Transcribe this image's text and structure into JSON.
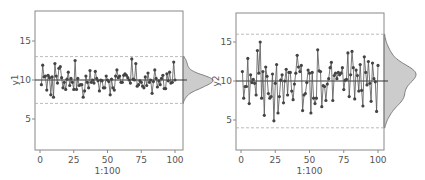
{
  "chart_data": [
    {
      "type": "line",
      "title": "",
      "xlabel": "1:100",
      "ylabel": "y1",
      "xlim": [
        -3,
        105
      ],
      "ylim": [
        1,
        18.7
      ],
      "xticks": [
        0,
        25,
        50,
        75,
        100
      ],
      "yticks": [
        5,
        10,
        15
      ],
      "grid": false,
      "center_line": 10,
      "control_limits": [
        7,
        13
      ],
      "marginal_density": true,
      "x": [
        1,
        2,
        3,
        4,
        5,
        6,
        7,
        8,
        9,
        10,
        11,
        12,
        13,
        14,
        15,
        16,
        17,
        18,
        19,
        20,
        21,
        22,
        23,
        24,
        25,
        26,
        27,
        28,
        29,
        30,
        31,
        32,
        33,
        34,
        35,
        36,
        37,
        38,
        39,
        40,
        41,
        42,
        43,
        44,
        45,
        46,
        47,
        48,
        49,
        50,
        51,
        52,
        53,
        54,
        55,
        56,
        57,
        58,
        59,
        60,
        61,
        62,
        63,
        64,
        65,
        66,
        67,
        68,
        69,
        70,
        71,
        72,
        73,
        74,
        75,
        76,
        77,
        78,
        79,
        80,
        81,
        82,
        83,
        84,
        85,
        86,
        87,
        88,
        89,
        90,
        91,
        92,
        93,
        94,
        95,
        96,
        97,
        98,
        99,
        100
      ],
      "values": [
        9.4,
        11.9,
        10.4,
        10.5,
        8.7,
        10.6,
        10.3,
        8.1,
        10.4,
        7.8,
        12.1,
        10.5,
        9.6,
        11.5,
        11.7,
        10.3,
        9.0,
        9.7,
        8.8,
        10.1,
        11.0,
        9.3,
        10.2,
        9.7,
        8.8,
        12.5,
        8.8,
        10.2,
        9.3,
        9.4,
        9.4,
        7.8,
        8.6,
        10.5,
        9.7,
        9.0,
        11.2,
        9.7,
        10.0,
        9.6,
        11.1,
        10.2,
        9.9,
        8.6,
        10.0,
        9.9,
        9.0,
        9.0,
        10.5,
        10.0,
        9.8,
        8.1,
        10.1,
        9.0,
        8.7,
        10.5,
        11.3,
        10.3,
        10.5,
        9.7,
        9.7,
        10.6,
        10.8,
        10.6,
        10.3,
        10.0,
        9.6,
        12.7,
        10.1,
        10.0,
        12.1,
        9.2,
        9.4,
        9.9,
        9.7,
        9.2,
        9.0,
        10.4,
        9.3,
        10.9,
        9.7,
        10.0,
        8.3,
        9.8,
        11.3,
        10.2,
        9.1,
        9.9,
        9.4,
        10.2,
        10.6,
        8.9,
        8.9,
        10.8,
        9.9,
        11.0,
        9.6,
        9.7,
        12.3,
        10.0,
        9.5
      ]
    },
    {
      "type": "line",
      "title": "",
      "xlabel": "1:100",
      "ylabel": "y2",
      "xlim": [
        -3,
        105
      ],
      "ylim": [
        1.2,
        18.6
      ],
      "xticks": [
        0,
        25,
        50,
        75,
        100
      ],
      "yticks": [
        5,
        10,
        15
      ],
      "grid": false,
      "center_line": 10,
      "control_limits": [
        4,
        16
      ],
      "marginal_density": true,
      "x": [
        1,
        2,
        3,
        4,
        5,
        6,
        7,
        8,
        9,
        10,
        11,
        12,
        13,
        14,
        15,
        16,
        17,
        18,
        19,
        20,
        21,
        22,
        23,
        24,
        25,
        26,
        27,
        28,
        29,
        30,
        31,
        32,
        33,
        34,
        35,
        36,
        37,
        38,
        39,
        40,
        41,
        42,
        43,
        44,
        45,
        46,
        47,
        48,
        49,
        50,
        51,
        52,
        53,
        54,
        55,
        56,
        57,
        58,
        59,
        60,
        61,
        62,
        63,
        64,
        65,
        66,
        67,
        68,
        69,
        70,
        71,
        72,
        73,
        74,
        75,
        76,
        77,
        78,
        79,
        80,
        81,
        82,
        83,
        84,
        85,
        86,
        87,
        88,
        89,
        90,
        91,
        92,
        93,
        94,
        95,
        96,
        97,
        98,
        99,
        100
      ],
      "values": [
        11.2,
        7.8,
        9.3,
        9.3,
        12.9,
        7.1,
        10.8,
        9.8,
        10.2,
        9.7,
        8.2,
        13.9,
        11.0,
        15.0,
        7.8,
        11.2,
        5.6,
        11.8,
        10.6,
        8.4,
        7.8,
        8.0,
        10.9,
        4.9,
        9.7,
        12.1,
        5.9,
        8.0,
        10.1,
        10.8,
        7.2,
        10.0,
        11.5,
        8.2,
        11.1,
        11.1,
        8.7,
        7.6,
        9.6,
        11.0,
        13.3,
        11.8,
        11.2,
        12.0,
        6.2,
        8.2,
        8.4,
        9.8,
        11.4,
        11.0,
        5.9,
        11.1,
        7.8,
        7.1,
        7.8,
        14.0,
        11.3,
        11.2,
        6.7,
        9.4,
        9.3,
        7.5,
        9.6,
        10.3,
        11.7,
        12.4,
        7.5,
        10.7,
        11.0,
        10.3,
        11.1,
        10.8,
        11.0,
        11.7,
        8.9,
        10.1,
        10.2,
        13.6,
        8.0,
        10.8,
        13.8,
        11.7,
        7.7,
        11.4,
        10.7,
        8.7,
        12.1,
        8.8,
        6.8,
        13.1,
        11.1,
        9.5,
        12.5,
        9.7,
        7.4,
        12.3,
        10.3,
        9.9,
        6.1,
        12.0
      ]
    }
  ],
  "plots": [
    {
      "ylabel": "y1",
      "xlabel": "1:100",
      "xtick_labels": [
        "0",
        "25",
        "50",
        "75",
        "100"
      ],
      "ytick_labels": [
        "5",
        "10",
        "15"
      ]
    },
    {
      "ylabel": "y2",
      "xlabel": "1:100",
      "xtick_labels": [
        "0",
        "25",
        "50",
        "75",
        "100"
      ],
      "ytick_labels": [
        "5",
        "10",
        "15"
      ]
    }
  ],
  "colors": {
    "frame": "#888888",
    "points": "#444444",
    "line": "#555555",
    "center_line": "#333333",
    "limit_line": "#aaaaaa",
    "density_fill": "#cccccc",
    "density_stroke": "#666666"
  }
}
